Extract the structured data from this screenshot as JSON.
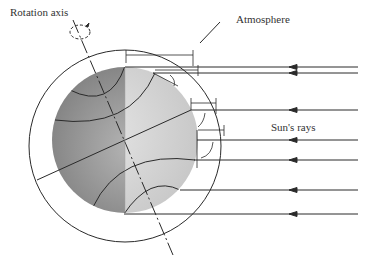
{
  "labels": {
    "rotation_axis": "Rotation axis",
    "atmosphere": "Atmosphere",
    "suns_rays": "Sun's rays"
  },
  "colors": {
    "line": "#2a2a2a",
    "sphere_dark": "#8c8c8c",
    "sphere_light": "#d8d8d8",
    "background": "#ffffff"
  },
  "diagram": {
    "earth": {
      "cx": 125,
      "cy": 140,
      "r": 73
    },
    "atmosphere": {
      "cx": 125,
      "cy": 146,
      "r": 96
    },
    "ray_y": [
      67,
      73,
      110,
      140,
      160,
      190,
      214
    ],
    "ray_start_x": 358,
    "arrow_x": 290
  }
}
